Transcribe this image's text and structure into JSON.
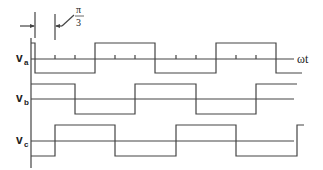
{
  "diagram": {
    "annotation": {
      "numerator": "π",
      "denominator": "3"
    },
    "axis_label": "ωt",
    "signals": [
      {
        "name": "v",
        "sub": "a"
      },
      {
        "name": "v",
        "sub": "b"
      },
      {
        "name": "v",
        "sub": "c"
      }
    ],
    "colors": {
      "line": "#444444",
      "text": "#222222"
    }
  }
}
